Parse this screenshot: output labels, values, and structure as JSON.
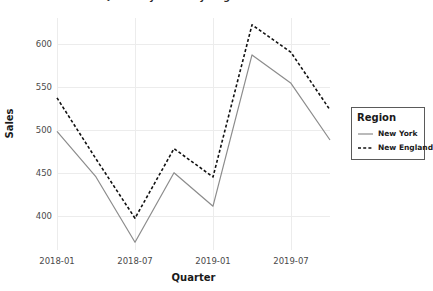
{
  "chart_data": {
    "type": "line",
    "title": "Quarterly Sales by Region",
    "xlabel": "Quarter",
    "ylabel": "Sales",
    "x": [
      "2018-01",
      "2018-04",
      "2018-07",
      "2018-10",
      "2019-01",
      "2019-04",
      "2019-07",
      "2019-10"
    ],
    "xtick_labels": [
      "2018-01",
      "2018-07",
      "2019-01",
      "2019-07"
    ],
    "xtick_values": [
      "2018-01",
      "2018-07",
      "2019-01",
      "2019-07"
    ],
    "ytick_labels": [
      "400",
      "450",
      "500",
      "550",
      "600"
    ],
    "ytick_values": [
      400,
      450,
      500,
      550,
      600
    ],
    "ylim": [
      360,
      630
    ],
    "grid": true,
    "legend_position": "right",
    "series": [
      {
        "name": "New York",
        "color": "#8c8c8c",
        "style": "solid",
        "values": [
          498,
          445,
          369,
          450,
          411,
          587,
          554,
          488
        ]
      },
      {
        "name": "New England",
        "color": "#111111",
        "style": "dashed",
        "values": [
          537,
          466,
          397,
          478,
          445,
          622,
          590,
          523
        ]
      }
    ]
  },
  "legend": {
    "title": "Region",
    "items": [
      {
        "label": "New York",
        "color": "#8c8c8c",
        "style": "solid"
      },
      {
        "label": "New England",
        "color": "#111111",
        "style": "dashed"
      }
    ]
  },
  "colors": {
    "grid": "#ececec",
    "axis_text": "#4a4a4a",
    "title_text": "#1a1a1a",
    "panel_background": "#ffffff",
    "legend_border": "#5a5a5a"
  }
}
